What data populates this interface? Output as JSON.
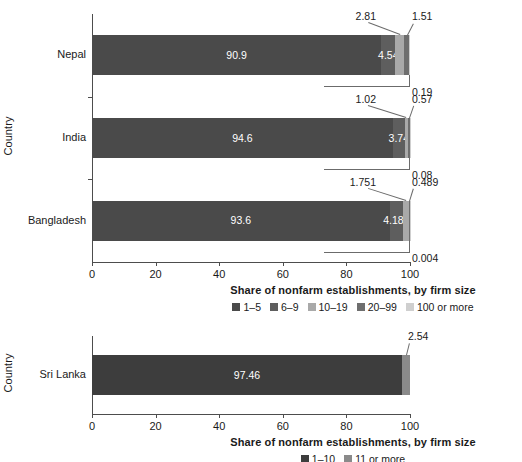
{
  "chart_data": [
    {
      "type": "bar",
      "orientation": "horizontal",
      "stacked": true,
      "panel": "top",
      "title": "",
      "xlabel": "Share of nonfarm establishments, by firm size",
      "ylabel": "Country",
      "xlim": [
        0,
        100
      ],
      "xticks": [
        0,
        20,
        40,
        60,
        80,
        100
      ],
      "xtick_labels": [
        "0",
        "20",
        "40",
        "60",
        "80",
        "100"
      ],
      "grid": false,
      "legend_position": "bottom",
      "categories": [
        "Nepal",
        "India",
        "Bangladesh"
      ],
      "series": [
        {
          "name": "1–5",
          "color": "#4a4a4a",
          "values": [
            90.9,
            94.6,
            93.6
          ],
          "labels": [
            "90.9",
            "94.6",
            "93.6"
          ],
          "label_style": "inside"
        },
        {
          "name": "6–9",
          "color": "#5e5e5e",
          "values": [
            4.54,
            3.74,
            4.18
          ],
          "labels": [
            "4.54",
            "3.74",
            "4.180"
          ],
          "label_style": "inside"
        },
        {
          "name": "10–19",
          "color": "#a9a9a9",
          "values": [
            2.81,
            1.02,
            1.751
          ],
          "labels": [
            "2.81",
            "1.02",
            "1.751"
          ],
          "label_style": "callout-above"
        },
        {
          "name": "20–99",
          "color": "#6e6e6e",
          "values": [
            1.51,
            0.57,
            0.489
          ],
          "labels": [
            "1.51",
            "0.57",
            "0.489"
          ],
          "label_style": "callout-above"
        },
        {
          "name": "100 or more",
          "color": "#cfcfcf",
          "values": [
            0.19,
            0.08,
            0.004
          ],
          "labels": [
            "0.19",
            "0.08",
            "0.004"
          ],
          "label_style": "callout-below"
        }
      ]
    },
    {
      "type": "bar",
      "orientation": "horizontal",
      "stacked": true,
      "panel": "bottom",
      "title": "",
      "xlabel": "Share of nonfarm establishments, by firm size",
      "ylabel": "Country",
      "xlim": [
        0,
        100
      ],
      "xticks": [
        0,
        20,
        40,
        60,
        80,
        100
      ],
      "xtick_labels": [
        "0",
        "20",
        "40",
        "60",
        "80",
        "100"
      ],
      "grid": false,
      "legend_position": "bottom",
      "categories": [
        "Sri Lanka"
      ],
      "series": [
        {
          "name": "1–10",
          "color": "#3d3d3d",
          "values": [
            97.46
          ],
          "labels": [
            "97.46"
          ],
          "label_style": "inside"
        },
        {
          "name": "11 or more",
          "color": "#8a8a8a",
          "values": [
            2.54
          ],
          "labels": [
            "2.54"
          ],
          "label_style": "callout-above"
        }
      ]
    }
  ],
  "top_chart": {
    "ylabel": "Country",
    "xlabel": "Share of nonfarm establishments, by firm size",
    "xtick_labels": [
      "0",
      "20",
      "40",
      "60",
      "80",
      "100"
    ],
    "ytick_labels": [
      "Nepal",
      "India",
      "Bangladesh"
    ],
    "legend": [
      {
        "label": "1–5",
        "color": "#4a4a4a"
      },
      {
        "label": "6–9",
        "color": "#5e5e5e"
      },
      {
        "label": "10–19",
        "color": "#a9a9a9"
      },
      {
        "label": "20–99",
        "color": "#6e6e6e"
      },
      {
        "label": "100 or more",
        "color": "#cfcfcf"
      }
    ],
    "rows": [
      {
        "country": "Nepal",
        "inside": [
          {
            "label": "90.9",
            "value": 90.9,
            "color": "#4a4a4a"
          },
          {
            "label": "4.54",
            "value": 4.54,
            "color": "#5e5e5e"
          }
        ],
        "callouts_above": [
          {
            "label": "2.81",
            "value": 2.81,
            "color": "#a9a9a9"
          },
          {
            "label": "1.51",
            "value": 1.51,
            "color": "#6e6e6e"
          }
        ],
        "callout_below": {
          "label": "0.19",
          "value": 0.19,
          "color": "#cfcfcf"
        }
      },
      {
        "country": "India",
        "inside": [
          {
            "label": "94.6",
            "value": 94.6,
            "color": "#4a4a4a"
          },
          {
            "label": "3.74",
            "value": 3.74,
            "color": "#5e5e5e"
          }
        ],
        "callouts_above": [
          {
            "label": "1.02",
            "value": 1.02,
            "color": "#a9a9a9"
          },
          {
            "label": "0.57",
            "value": 0.57,
            "color": "#6e6e6e"
          }
        ],
        "callout_below": {
          "label": "0.08",
          "value": 0.08,
          "color": "#cfcfcf"
        }
      },
      {
        "country": "Bangladesh",
        "inside": [
          {
            "label": "93.6",
            "value": 93.6,
            "color": "#4a4a4a"
          },
          {
            "label": "4.180",
            "value": 4.18,
            "color": "#5e5e5e"
          }
        ],
        "callouts_above": [
          {
            "label": "1.751",
            "value": 1.751,
            "color": "#a9a9a9"
          },
          {
            "label": "0.489",
            "value": 0.489,
            "color": "#6e6e6e"
          }
        ],
        "callout_below": {
          "label": "0.004",
          "value": 0.004,
          "color": "#cfcfcf"
        }
      }
    ]
  },
  "bottom_chart": {
    "ylabel": "Country",
    "xlabel": "Share of nonfarm establishments, by firm size",
    "xtick_labels": [
      "0",
      "20",
      "40",
      "60",
      "80",
      "100"
    ],
    "ytick_labels": [
      "Sri Lanka"
    ],
    "legend": [
      {
        "label": "1–10",
        "color": "#3d3d3d"
      },
      {
        "label": "11 or more",
        "color": "#8a8a8a"
      }
    ],
    "rows": [
      {
        "country": "Sri Lanka",
        "inside": [
          {
            "label": "97.46",
            "value": 97.46,
            "color": "#3d3d3d"
          }
        ],
        "callouts_above": [
          {
            "label": "2.54",
            "value": 2.54,
            "color": "#8a8a8a"
          }
        ],
        "callout_below": null
      }
    ]
  }
}
